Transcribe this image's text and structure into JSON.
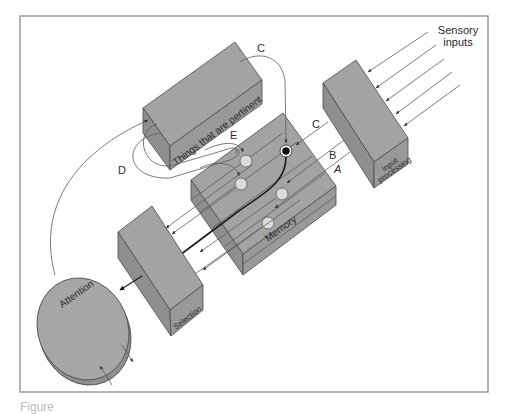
{
  "figure": {
    "labels": {
      "sensory_inputs_line1": "Sensory",
      "sensory_inputs_line2": "inputs",
      "input_processing_line1": "Input",
      "input_processing_line2": "processing",
      "memory": "Memory",
      "things_pertinent": "Things that are pertinent",
      "selection": "Selection",
      "attention": "Attention"
    },
    "pathway_letters": {
      "a": "A",
      "b": "B",
      "c_top": "C",
      "c_mid": "C",
      "d": "D",
      "e": "E"
    },
    "caption_partial": "Figure"
  },
  "colors": {
    "box_fill": "#a3a3a3",
    "box_side": "#8f8f8f",
    "node_fill": "#dcdcdc",
    "active_node": "#111111",
    "frame": "#8c8c8c"
  }
}
